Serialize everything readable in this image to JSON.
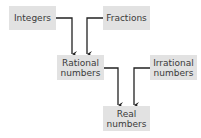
{
  "diagram": {
    "title": "",
    "nodes": {
      "integers": {
        "label": "Integers"
      },
      "fractions": {
        "label": "Fractions"
      },
      "rational": {
        "line1": "Rational",
        "line2": "numbers"
      },
      "irrational": {
        "line1": "Irrational",
        "line2": "numbers"
      },
      "real": {
        "line1": "Real",
        "line2": "numbers"
      }
    },
    "edges": [
      {
        "from": "Integers",
        "to": "Rational numbers"
      },
      {
        "from": "Fractions",
        "to": "Rational numbers"
      },
      {
        "from": "Rational numbers",
        "to": "Real numbers"
      },
      {
        "from": "Irrational numbers",
        "to": "Real numbers"
      }
    ],
    "colors": {
      "box": "#e2e2e2",
      "arrow": "#222222",
      "text": "#3a3a3a"
    }
  }
}
